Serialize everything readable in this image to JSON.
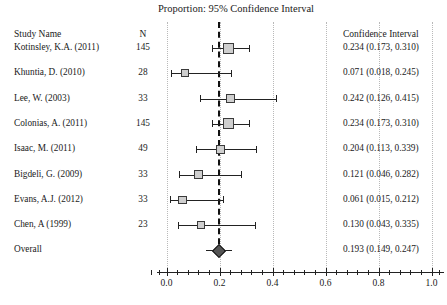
{
  "title": "Proportion: 95% Confidence Interval",
  "columns": {
    "study_name": "Study Name",
    "n": "N",
    "confidence_interval": "Confidence Interval"
  },
  "overall_label": "Overall",
  "chart_data": {
    "type": "scatter",
    "subtype": "forest-plot",
    "title": "Proportion: 95% Confidence Interval",
    "xlabel": "",
    "ylabel": "",
    "xlim": [
      0.0,
      1.08
    ],
    "grid": true,
    "gridlines_at": [
      0.2,
      0.4,
      0.6,
      0.8,
      1.0
    ],
    "tick_labels": [
      "0.0",
      "0.2",
      "0.4",
      "0.6",
      "0.8",
      "1.0"
    ],
    "tick_values": [
      0.0,
      0.2,
      0.4,
      0.6,
      0.8,
      1.0
    ],
    "minor_ticks_per_interval": 4,
    "reference_line": 0.193,
    "columns": [
      "Study Name",
      "N",
      "Confidence Interval"
    ],
    "rows": [
      {
        "study": "Kotinsley, K.A. (2011)",
        "n": "145",
        "estimate": 0.234,
        "lower": 0.173,
        "upper": 0.31,
        "ci_text": "0.234 (0.173, 0.310)",
        "weight": 1.0
      },
      {
        "study": "Khuntia, D. (2010)",
        "n": "28",
        "estimate": 0.071,
        "lower": 0.018,
        "upper": 0.245,
        "ci_text": "0.071 (0.018, 0.245)",
        "weight": 0.42
      },
      {
        "study": "Lee, W. (2003)",
        "n": "33",
        "estimate": 0.242,
        "lower": 0.126,
        "upper": 0.415,
        "ci_text": "0.242 (0.126, 0.415)",
        "weight": 0.5
      },
      {
        "study": "Colonias, A. (2011)",
        "n": "145",
        "estimate": 0.234,
        "lower": 0.173,
        "upper": 0.31,
        "ci_text": "0.234 (0.173, 0.310)",
        "weight": 1.0
      },
      {
        "study": "Isaac, M. (2011)",
        "n": "49",
        "estimate": 0.204,
        "lower": 0.113,
        "upper": 0.339,
        "ci_text": "0.204 (0.113, 0.339)",
        "weight": 0.62
      },
      {
        "study": "Bigdeli, G. (2009)",
        "n": "33",
        "estimate": 0.121,
        "lower": 0.046,
        "upper": 0.282,
        "ci_text": "0.121 (0.046, 0.282)",
        "weight": 0.5
      },
      {
        "study": "Evans, A.J. (2012)",
        "n": "33",
        "estimate": 0.061,
        "lower": 0.015,
        "upper": 0.212,
        "ci_text": "0.061 (0.015, 0.212)",
        "weight": 0.5
      },
      {
        "study": "Chen, A (1999)",
        "n": "23",
        "estimate": 0.13,
        "lower": 0.043,
        "upper": 0.335,
        "ci_text": "0.130 (0.043, 0.335)",
        "weight": 0.42
      }
    ],
    "overall": {
      "study": "Overall",
      "n": "",
      "estimate": 0.193,
      "lower": 0.149,
      "upper": 0.247,
      "ci_text": "0.193 (0.149, 0.247)"
    }
  }
}
